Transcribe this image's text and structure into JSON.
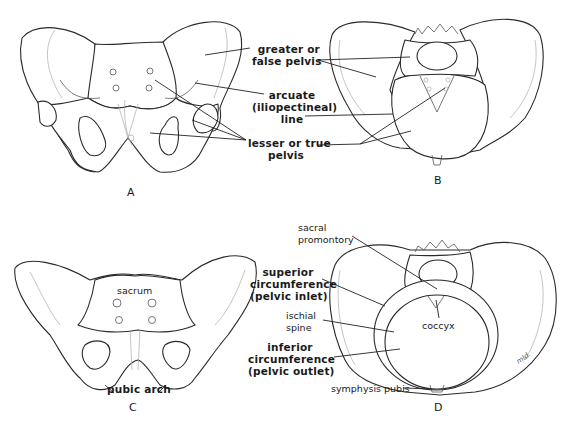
{
  "panels": {
    "A": {
      "letter": "A"
    },
    "B": {
      "letter": "B"
    },
    "C": {
      "letter": "C"
    },
    "D": {
      "letter": "D"
    }
  },
  "labels": {
    "top_center": {
      "greater_pelvis_1": "greater or",
      "greater_pelvis_2": "false pelvis",
      "arcuate_1": "arcuate",
      "arcuate_2": "(iliopectineal)",
      "arcuate_3": "line",
      "lesser_pelvis_1": "lesser or true",
      "lesser_pelvis_2": "pelvis"
    },
    "panel_C": {
      "sacrum": "sacrum",
      "pubic_arch": "pubic arch"
    },
    "bottom_center": {
      "superior_1": "superior",
      "superior_2": "circumference",
      "superior_3": "(pelvic inlet)",
      "ischial_1": "ischial",
      "ischial_2": "spine",
      "inferior_1": "inferior",
      "inferior_2": "circumference",
      "inferior_3": "(pelvic outlet)"
    },
    "panel_D": {
      "sacral_1": "sacral",
      "sacral_2": "promontory",
      "coccyx": "coccyx",
      "symphysis": "symphysis pubis",
      "signature": "mld."
    }
  }
}
